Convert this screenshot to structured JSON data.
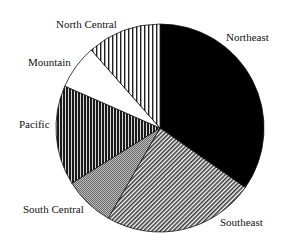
{
  "chart_data": {
    "type": "pie",
    "title": "",
    "center": [
      160,
      128
    ],
    "radius": 104,
    "start_angle_deg": 0,
    "direction": "clockwise",
    "legend": "none (direct labels)",
    "slices": [
      {
        "label": "Northeast",
        "value": 34.7,
        "pattern": "solid-black",
        "label_pos": [
          226,
          41
        ]
      },
      {
        "label": "Southeast",
        "value": 23.6,
        "pattern": "fine-diagonal",
        "label_pos": [
          220,
          226
        ]
      },
      {
        "label": "South Central",
        "value": 7.8,
        "pattern": "fine-gray",
        "label_pos": [
          23,
          213
        ]
      },
      {
        "label": "Pacific",
        "value": 15.5,
        "pattern": "dense-vertical-dark",
        "label_pos": [
          19,
          128
        ]
      },
      {
        "label": "Mountain",
        "value": 6.9,
        "pattern": "white",
        "label_pos": [
          28,
          66
        ]
      },
      {
        "label": "North Central",
        "value": 11.5,
        "pattern": "sparse-vertical",
        "label_pos": [
          56,
          28
        ]
      }
    ]
  }
}
